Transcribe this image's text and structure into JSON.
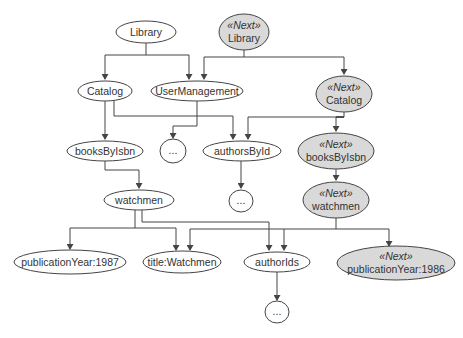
{
  "diagram": {
    "type": "object-tree-versioned",
    "colors": {
      "current_fill": "#ffffff",
      "next_fill": "#d9d9d9",
      "stroke": "#444444",
      "text": "#333333"
    },
    "stereotype": "«Next»",
    "nodes": [
      {
        "id": "library",
        "label": "Library",
        "next": false
      },
      {
        "id": "next_library",
        "label": "Library",
        "next": true
      },
      {
        "id": "catalog",
        "label": "Catalog",
        "next": false
      },
      {
        "id": "usermanagement",
        "label": "UserManagement",
        "next": false
      },
      {
        "id": "next_catalog",
        "label": "Catalog",
        "next": true
      },
      {
        "id": "booksbyisbn",
        "label": "booksByIsbn",
        "next": false
      },
      {
        "id": "ellipsis_um",
        "label": "...",
        "next": false
      },
      {
        "id": "authorsbyid",
        "label": "authorsById",
        "next": false
      },
      {
        "id": "next_booksbyisbn",
        "label": "booksByIsbn",
        "next": true
      },
      {
        "id": "ellipsis_authors",
        "label": "...",
        "next": false
      },
      {
        "id": "watchmen",
        "label": "watchmen",
        "next": false
      },
      {
        "id": "next_watchmen",
        "label": "watchmen",
        "next": true
      },
      {
        "id": "pubyear1987",
        "label": "publicationYear:1987",
        "next": false
      },
      {
        "id": "title",
        "label": "title:Watchmen",
        "next": false
      },
      {
        "id": "authorids",
        "label": "authorIds",
        "next": false
      },
      {
        "id": "next_pubyear1986",
        "label": "publicationYear:1986",
        "next": true
      },
      {
        "id": "ellipsis_authorids",
        "label": "...",
        "next": false
      }
    ],
    "edges": [
      {
        "from": "library",
        "to": "catalog"
      },
      {
        "from": "library",
        "to": "usermanagement"
      },
      {
        "from": "next_library",
        "to": "usermanagement"
      },
      {
        "from": "next_library",
        "to": "next_catalog"
      },
      {
        "from": "catalog",
        "to": "booksbyisbn"
      },
      {
        "from": "catalog",
        "to": "authorsbyid"
      },
      {
        "from": "usermanagement",
        "to": "ellipsis_um"
      },
      {
        "from": "next_catalog",
        "to": "authorsbyid"
      },
      {
        "from": "next_catalog",
        "to": "next_booksbyisbn"
      },
      {
        "from": "authorsbyid",
        "to": "ellipsis_authors"
      },
      {
        "from": "booksbyisbn",
        "to": "watchmen"
      },
      {
        "from": "next_booksbyisbn",
        "to": "next_watchmen"
      },
      {
        "from": "watchmen",
        "to": "pubyear1987"
      },
      {
        "from": "watchmen",
        "to": "title"
      },
      {
        "from": "watchmen",
        "to": "authorids"
      },
      {
        "from": "next_watchmen",
        "to": "title"
      },
      {
        "from": "next_watchmen",
        "to": "authorids"
      },
      {
        "from": "next_watchmen",
        "to": "next_pubyear1986"
      },
      {
        "from": "authorids",
        "to": "ellipsis_authorids"
      }
    ]
  }
}
